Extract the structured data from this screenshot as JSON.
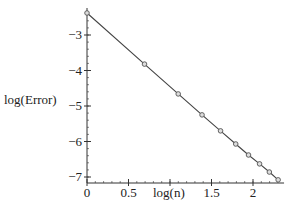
{
  "chart_data": {
    "type": "line",
    "title": "",
    "xlabel": "log(n)",
    "ylabel": "log(Error)",
    "x_ticks": [
      0,
      0.5,
      1,
      1.5,
      2
    ],
    "x_tick_labels": [
      "0",
      "0.5",
      "",
      "1.5",
      "2"
    ],
    "y_ticks": [
      -3,
      -4,
      -5,
      -6,
      -7
    ],
    "y_tick_labels": [
      "-3",
      "-4",
      "-5",
      "-6",
      "-7"
    ],
    "xlim": [
      0,
      2.35
    ],
    "ylim": [
      -7.17,
      -2.3
    ],
    "grid": false,
    "legend": null,
    "series": [
      {
        "name": "log(Error) vs log(n)",
        "marker": "circle",
        "line": true,
        "color": "#444444",
        "x": [
          0.0,
          0.693,
          1.099,
          1.386,
          1.609,
          1.792,
          1.946,
          2.079,
          2.197,
          2.303
        ],
        "y": [
          -2.38,
          -3.82,
          -4.66,
          -5.25,
          -5.7,
          -6.07,
          -6.38,
          -6.63,
          -6.86,
          -7.08
        ]
      }
    ]
  }
}
